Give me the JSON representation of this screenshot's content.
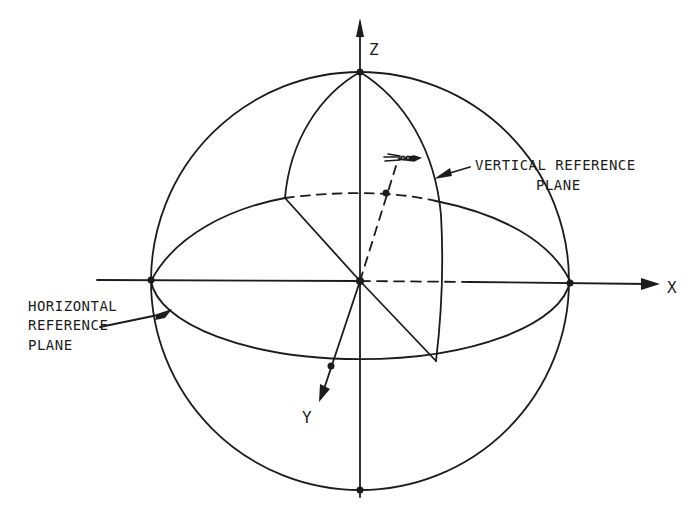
{
  "diagram": {
    "type": "spherical-coordinate-reference-diagram",
    "colors": {
      "ink": "#1c1c1c",
      "background": "#ffffff"
    },
    "axes": {
      "x": {
        "label": "X"
      },
      "y": {
        "label": "Y"
      },
      "z": {
        "label": "Z"
      }
    },
    "callouts": {
      "vertical_plane": {
        "line1": "VERTICAL REFERENCE",
        "line2": "PLANE"
      },
      "horizontal_plane": {
        "line1": "HORIZONTAL",
        "line2": "REFERENCE",
        "line3": "PLANE"
      }
    },
    "icons": [
      "aircraft-icon"
    ]
  }
}
